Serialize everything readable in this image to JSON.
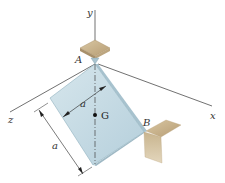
{
  "diagram": {
    "type": "engineering-mechanics-figure",
    "axes": {
      "x_label": "x",
      "y_label": "y",
      "z_label": "z"
    },
    "points": {
      "A": "A",
      "B": "B",
      "G": "G"
    },
    "dimensions": {
      "width_label": "a",
      "height_label": "a"
    },
    "colors": {
      "plate_fill": "#c9dde6",
      "plate_edge": "#9bb7c4",
      "support": "#c9b594",
      "axis_line": "#333333"
    }
  }
}
